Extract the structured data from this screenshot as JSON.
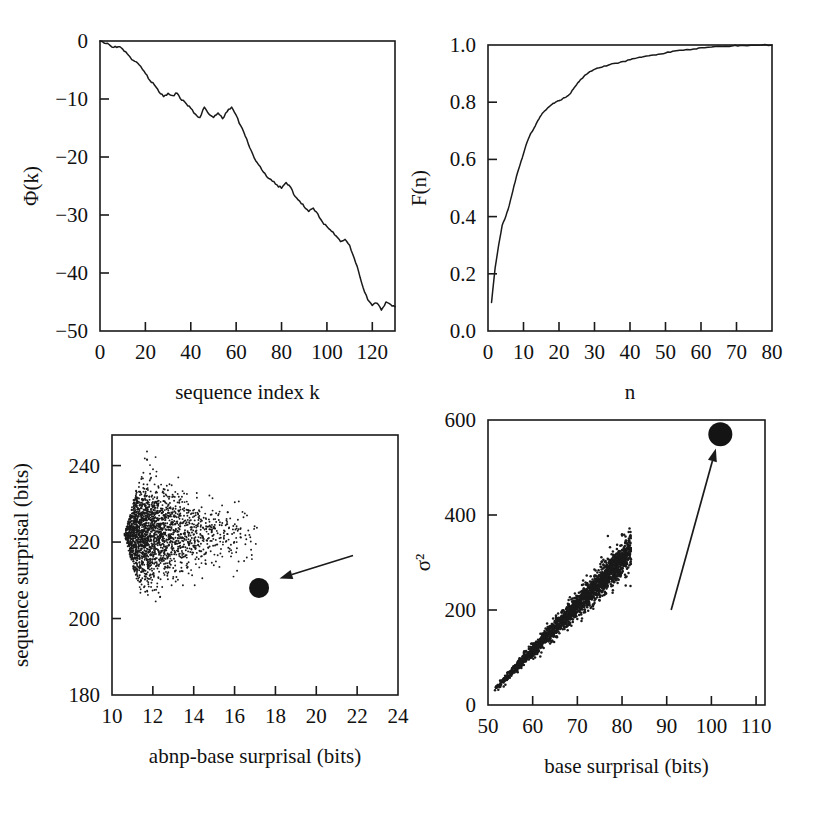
{
  "figure": {
    "background": "#ffffff",
    "ink": "#1a1a1a",
    "panel_count": 4
  },
  "chart_data": [
    {
      "id": "panel-top-left",
      "type": "line",
      "title": "",
      "xlabel": "sequence index k",
      "ylabel": "Φ(k)",
      "xlim": [
        0,
        130
      ],
      "ylim": [
        -50,
        0
      ],
      "xticks": [
        0,
        20,
        40,
        60,
        80,
        100,
        120
      ],
      "xticklabels": [
        "0",
        "20",
        "40",
        "60",
        "80",
        "100",
        "120"
      ],
      "yticks": [
        -50,
        -40,
        -30,
        -20,
        -10,
        0
      ],
      "yticklabels": [
        "−50",
        "−40",
        "−30",
        "−20",
        "−10",
        "0"
      ],
      "grid": false,
      "legend": "none",
      "x": [
        0,
        2,
        4,
        6,
        8,
        10,
        12,
        14,
        16,
        18,
        20,
        22,
        24,
        26,
        28,
        30,
        32,
        34,
        36,
        38,
        40,
        42,
        44,
        46,
        48,
        50,
        52,
        54,
        56,
        58,
        60,
        62,
        64,
        66,
        68,
        70,
        72,
        74,
        76,
        78,
        80,
        82,
        84,
        86,
        88,
        90,
        92,
        94,
        96,
        98,
        100,
        102,
        104,
        106,
        108,
        110,
        112,
        114,
        116,
        118,
        120,
        122,
        124,
        126,
        128,
        130
      ],
      "values": [
        0,
        -0.4,
        -0.6,
        -1.1,
        -1.0,
        -1.4,
        -2.2,
        -3.2,
        -3.6,
        -4.4,
        -5.6,
        -6.8,
        -7.6,
        -8.8,
        -9.6,
        -9.0,
        -9.4,
        -9.0,
        -10.2,
        -10.8,
        -11.6,
        -12.6,
        -13.2,
        -11.4,
        -12.6,
        -13.2,
        -12.4,
        -13.4,
        -12.2,
        -11.4,
        -12.8,
        -14.6,
        -16.4,
        -18.4,
        -20.2,
        -21.4,
        -22.6,
        -23.6,
        -24.2,
        -24.8,
        -25.4,
        -24.4,
        -25.2,
        -26.8,
        -27.6,
        -28.6,
        -29.4,
        -28.8,
        -29.8,
        -31.2,
        -32.0,
        -32.8,
        -33.6,
        -34.6,
        -34.2,
        -35.2,
        -37.4,
        -39.8,
        -42.6,
        -44.6,
        -45.6,
        -45.2,
        -46.4,
        -45.0,
        -45.4,
        -45.8
      ]
    },
    {
      "id": "panel-top-right",
      "type": "line",
      "title": "",
      "xlabel": "n",
      "ylabel": "F(n)",
      "xlim": [
        0,
        80
      ],
      "ylim": [
        0.0,
        1.0
      ],
      "xticks": [
        0,
        10,
        20,
        30,
        40,
        50,
        60,
        70,
        80
      ],
      "xticklabels": [
        "0",
        "10",
        "20",
        "30",
        "40",
        "50",
        "60",
        "70",
        "80"
      ],
      "yticks": [
        0.0,
        0.2,
        0.4,
        0.6,
        0.8,
        1.0
      ],
      "yticklabels": [
        "0.0",
        "0.2",
        "0.4",
        "0.6",
        "0.8",
        "1.0"
      ],
      "grid": false,
      "legend": "none",
      "x": [
        1,
        2,
        3,
        4,
        5,
        6,
        7,
        8,
        9,
        10,
        11,
        12,
        13,
        14,
        15,
        16,
        17,
        18,
        19,
        20,
        21,
        22,
        23,
        24,
        25,
        26,
        27,
        28,
        29,
        30,
        32,
        34,
        36,
        38,
        40,
        42,
        44,
        46,
        48,
        50,
        52,
        55,
        58,
        60,
        63,
        66,
        69,
        71,
        74,
        77,
        80
      ],
      "values": [
        0.1,
        0.22,
        0.3,
        0.37,
        0.4,
        0.44,
        0.49,
        0.54,
        0.58,
        0.62,
        0.66,
        0.69,
        0.71,
        0.735,
        0.755,
        0.77,
        0.782,
        0.792,
        0.8,
        0.805,
        0.812,
        0.818,
        0.828,
        0.845,
        0.862,
        0.878,
        0.89,
        0.9,
        0.908,
        0.915,
        0.922,
        0.93,
        0.936,
        0.942,
        0.948,
        0.955,
        0.96,
        0.964,
        0.968,
        0.972,
        0.978,
        0.982,
        0.986,
        0.99,
        0.993,
        0.995,
        0.997,
        0.998,
        0.999,
        1.0,
        1.0
      ]
    },
    {
      "id": "panel-bottom-left",
      "type": "scatter",
      "title": "",
      "xlabel": "abnp-base surprisal (bits)",
      "ylabel": "sequence surprisal (bits)",
      "xlim": [
        10,
        24
      ],
      "ylim": [
        180,
        248
      ],
      "xticks": [
        10,
        12,
        14,
        16,
        18,
        20,
        22,
        24
      ],
      "xticklabels": [
        "10",
        "12",
        "14",
        "16",
        "18",
        "20",
        "22",
        "24"
      ],
      "yticks": [
        180,
        200,
        220,
        240
      ],
      "yticklabels": [
        "180",
        "200",
        "220",
        "240"
      ],
      "grid": false,
      "legend": "none",
      "cloud": {
        "n_points": 2600,
        "description": "dense comet-shaped cloud, densest near x=10-13 y=218-232, fanning right and thinning toward x=22",
        "x_center": 10.6,
        "y_center": 222,
        "x_spread": 2.6,
        "y_spread": 8.0
      },
      "highlight_point": {
        "x": 17.2,
        "y": 208,
        "marker": "filled-circle",
        "size_px": 20
      },
      "annotation_arrow": {
        "from": [
          21.8,
          216.5
        ],
        "to": [
          18.2,
          210.5
        ]
      }
    },
    {
      "id": "panel-bottom-right",
      "type": "scatter",
      "title": "",
      "xlabel": "base surprisal (bits)",
      "ylabel": "σ²",
      "xlim": [
        50,
        112
      ],
      "ylim": [
        0,
        600
      ],
      "xticks": [
        50,
        60,
        70,
        80,
        90,
        100,
        110
      ],
      "xticklabels": [
        "50",
        "60",
        "70",
        "80",
        "90",
        "100",
        "110"
      ],
      "yticks": [
        0,
        200,
        400,
        600
      ],
      "yticklabels": [
        "0",
        "200",
        "400",
        "600"
      ],
      "grid": false,
      "legend": "none",
      "cloud": {
        "n_points": 2000,
        "description": "tight elongated positively-correlated band from (52,35) to (80,300), widening with x",
        "x_min": 51.5,
        "x_max": 82,
        "slope": 9.6,
        "intercept": -462,
        "scatter_sd": 14
      },
      "highlight_point": {
        "x": 102,
        "y": 570,
        "marker": "filled-circle",
        "size_px": 24
      },
      "annotation_arrow": {
        "from": [
          91,
          200
        ],
        "to": [
          101,
          540
        ]
      }
    }
  ]
}
